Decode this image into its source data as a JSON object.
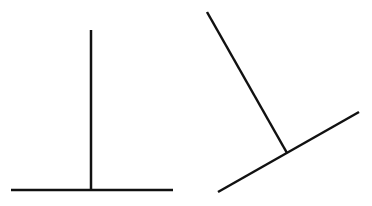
{
  "figures": [
    {
      "name": "upright-t",
      "stroke": "#111111",
      "lines": [
        {
          "role": "base",
          "x1": 11,
          "y1": 190,
          "x2": 173,
          "y2": 190
        },
        {
          "role": "stem",
          "x1": 91,
          "y1": 30,
          "x2": 91,
          "y2": 190
        }
      ]
    },
    {
      "name": "rotated-t",
      "stroke": "#111111",
      "lines": [
        {
          "role": "base",
          "x1": 218,
          "y1": 192,
          "x2": 359,
          "y2": 112
        },
        {
          "role": "stem",
          "x1": 207,
          "y1": 12,
          "x2": 287,
          "y2": 153
        }
      ]
    }
  ]
}
